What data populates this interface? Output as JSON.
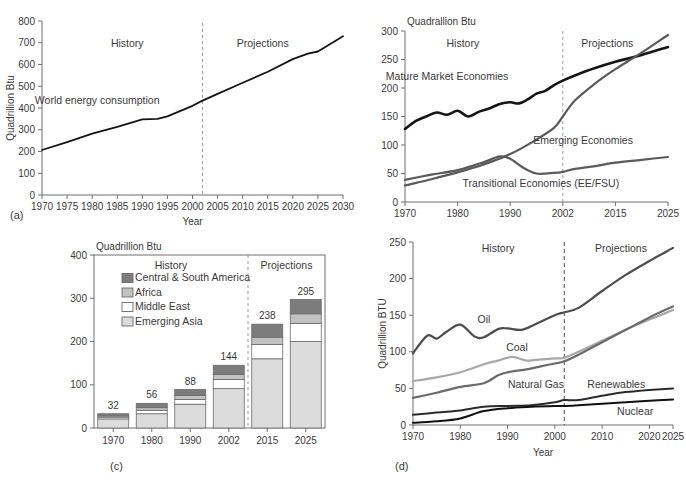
{
  "figure": {
    "panel_labels": [
      "(a)",
      "(b)",
      "(c)",
      "(d)"
    ]
  },
  "chart_data": [
    {
      "id": "a",
      "type": "line",
      "panel_label": "(a)",
      "title": "",
      "xlabel": "Year",
      "ylabel": "Quadrillion Btu",
      "xlim": [
        1970,
        2030
      ],
      "ylim": [
        0,
        800
      ],
      "xticks": [
        1970,
        1975,
        1980,
        1985,
        1990,
        1995,
        2000,
        2005,
        2010,
        2015,
        2020,
        2025,
        2030
      ],
      "yticks": [
        0,
        100,
        200,
        300,
        400,
        500,
        600,
        700,
        800
      ],
      "grid": false,
      "annotations": [
        {
          "text": "History",
          "x": 1987,
          "y": 680
        },
        {
          "text": "Projections",
          "x": 2014,
          "y": 680
        },
        {
          "text": "World energy consumption",
          "x": 1981,
          "y": 420
        }
      ],
      "divider_year": 2002,
      "series": [
        {
          "name": "World energy consumption",
          "color": "#141414",
          "x": [
            1970,
            1975,
            1980,
            1985,
            1990,
            1993,
            1995,
            2000,
            2002,
            2005,
            2010,
            2015,
            2020,
            2023,
            2025,
            2030
          ],
          "values": [
            207,
            243,
            282,
            313,
            348,
            350,
            362,
            410,
            434,
            465,
            516,
            567,
            625,
            650,
            660,
            730
          ]
        }
      ]
    },
    {
      "id": "b",
      "type": "line",
      "panel_label": "(b)",
      "title": "Quadrallion Btu",
      "xlabel": "",
      "ylabel": "",
      "xlim": [
        1970,
        2025
      ],
      "ylim": [
        0,
        300
      ],
      "xticks": [
        1970,
        1980,
        1990,
        2002,
        2015,
        2025
      ],
      "yticks": [
        0,
        50,
        100,
        150,
        200,
        250,
        300
      ],
      "grid": false,
      "divider_year": 2002,
      "annotations": [
        {
          "text": "History",
          "x": 1981,
          "y": 272
        },
        {
          "text": "Projections",
          "x": 2013,
          "y": 272
        },
        {
          "text": "Mature Market Economies",
          "x": 1978,
          "y": 214
        },
        {
          "text": "Emerging Economies",
          "x": 2007,
          "y": 101
        },
        {
          "text": "Transitional Economies (EE/FSU)",
          "x": 1997,
          "y": 27
        }
      ],
      "series": [
        {
          "name": "Mature Market Economies",
          "color": "#151515",
          "width": 2.6,
          "x": [
            1970,
            1972,
            1974,
            1976,
            1978,
            1980,
            1982,
            1984,
            1986,
            1988,
            1990,
            1992,
            1994,
            1996,
            1998,
            2000,
            2002,
            2005,
            2010,
            2015,
            2020,
            2025
          ],
          "values": [
            128,
            142,
            150,
            157,
            153,
            160,
            150,
            158,
            164,
            172,
            175,
            173,
            180,
            190,
            195,
            205,
            213,
            222,
            235,
            246,
            258,
            272
          ]
        },
        {
          "name": "Emerging Economies",
          "color": "#5a5a5a",
          "width": 2.2,
          "x": [
            1970,
            1975,
            1980,
            1985,
            1990,
            1995,
            2000,
            2002,
            2005,
            2010,
            2015,
            2020,
            2025
          ],
          "values": [
            29,
            40,
            52,
            66,
            84,
            105,
            130,
            150,
            178,
            208,
            233,
            262,
            293
          ]
        },
        {
          "name": "Transitional Economies (EE/FSU)",
          "color": "#5a5a5a",
          "width": 2.2,
          "x": [
            1970,
            1975,
            1980,
            1985,
            1988,
            1990,
            1993,
            1996,
            2000,
            2002,
            2005,
            2010,
            2015,
            2020,
            2025
          ],
          "values": [
            39,
            48,
            56,
            70,
            80,
            76,
            60,
            50,
            51,
            53,
            58,
            63,
            69,
            74,
            79
          ]
        }
      ]
    },
    {
      "id": "c",
      "type": "bar",
      "panel_label": "(c)",
      "title": "Quadrillion Btu",
      "xlabel": "",
      "ylabel": "",
      "stacked": true,
      "ylim": [
        0,
        400
      ],
      "yticks": [
        0,
        100,
        200,
        300,
        400
      ],
      "categories": [
        "1970",
        "1980",
        "1990",
        "2002",
        "2015",
        "2025"
      ],
      "totals": [
        32,
        56,
        88,
        144,
        238,
        295
      ],
      "divider_after_category": "2002",
      "annotations": [
        {
          "text": "History",
          "x": "center-left"
        },
        {
          "text": "Projections",
          "x": "center-right"
        }
      ],
      "legend": [
        {
          "label": "Central & South America",
          "color": "#7c7c7c"
        },
        {
          "label": "Africa",
          "color": "#c2c2c2"
        },
        {
          "label": "Middle East",
          "color": "#ffffff"
        },
        {
          "label": "Emerging Asia",
          "color": "#dcdcdc"
        }
      ],
      "series": [
        {
          "name": "Emerging Asia",
          "color": "#dcdcdc",
          "values": [
            21,
            33,
            55,
            91,
            160,
            200
          ]
        },
        {
          "name": "Middle East",
          "color": "#ffffff",
          "values": [
            4,
            8,
            11,
            21,
            33,
            42
          ]
        },
        {
          "name": "Africa",
          "color": "#c2c2c2",
          "values": [
            3,
            6,
            9,
            12,
            17,
            22
          ]
        },
        {
          "name": "Central & South America",
          "color": "#7c7c7c",
          "values": [
            5,
            10,
            14,
            21,
            30,
            33
          ]
        }
      ]
    },
    {
      "id": "d",
      "type": "line",
      "panel_label": "(d)",
      "title": "",
      "xlabel": "Year",
      "ylabel": "Quadrillion BTU",
      "xlim": [
        1970,
        2025
      ],
      "ylim": [
        0,
        250
      ],
      "xticks": [
        1970,
        1980,
        1990,
        2000,
        2010,
        2020,
        2025
      ],
      "yticks": [
        0,
        50,
        100,
        150,
        200,
        250
      ],
      "grid": false,
      "divider_year": 2002,
      "annotations": [
        {
          "text": "History",
          "x": 1988,
          "y": 237
        },
        {
          "text": "Projections",
          "x": 2014,
          "y": 237
        },
        {
          "text": "Oil",
          "x": 1985,
          "y": 140
        },
        {
          "text": "Coal",
          "x": 1992,
          "y": 101
        },
        {
          "text": "Natural Gas",
          "x": 1996,
          "y": 51
        },
        {
          "text": "Renewables",
          "x": 2013,
          "y": 51
        },
        {
          "text": "Nuclear",
          "x": 2017,
          "y": 14
        }
      ],
      "series": [
        {
          "name": "Oil",
          "color": "#4d4d4d",
          "width": 2.2,
          "x": [
            1970,
            1973,
            1975,
            1977,
            1980,
            1983,
            1985,
            1988,
            1990,
            1993,
            1996,
            2000,
            2002,
            2005,
            2010,
            2015,
            2020,
            2025
          ],
          "values": [
            98,
            122,
            118,
            127,
            137,
            121,
            120,
            131,
            132,
            130,
            138,
            150,
            154,
            160,
            183,
            205,
            224,
            242
          ]
        },
        {
          "name": "Coal",
          "color": "#a8a8a8",
          "width": 2.2,
          "x": [
            1970,
            1975,
            1980,
            1985,
            1988,
            1991,
            1994,
            1996,
            2000,
            2002,
            2005,
            2010,
            2015,
            2020,
            2025
          ],
          "values": [
            60,
            65,
            72,
            83,
            88,
            93,
            88,
            89,
            91,
            92,
            100,
            115,
            130,
            144,
            157
          ]
        },
        {
          "name": "Natural Gas",
          "color": "#6b6b6b",
          "width": 2.2,
          "x": [
            1970,
            1975,
            1980,
            1985,
            1988,
            1990,
            1994,
            1997,
            2000,
            2002,
            2005,
            2010,
            2015,
            2020,
            2025
          ],
          "values": [
            37,
            44,
            52,
            57,
            68,
            72,
            76,
            80,
            84,
            87,
            96,
            113,
            130,
            147,
            162
          ]
        },
        {
          "name": "Renewables",
          "color": "#2b2b2b",
          "width": 2.0,
          "x": [
            1970,
            1975,
            1980,
            1985,
            1990,
            1995,
            2000,
            2002,
            2005,
            2010,
            2015,
            2020,
            2025
          ],
          "values": [
            14,
            17,
            20,
            25,
            26,
            27,
            31,
            34,
            34,
            40,
            45,
            48,
            50
          ]
        },
        {
          "name": "Nuclear",
          "color": "#111111",
          "width": 2.0,
          "x": [
            1970,
            1975,
            1980,
            1985,
            1990,
            1995,
            2000,
            2002,
            2005,
            2010,
            2015,
            2020,
            2025
          ],
          "values": [
            3,
            5,
            9,
            19,
            23,
            25,
            26,
            26,
            27,
            29,
            31,
            33,
            35
          ]
        }
      ]
    }
  ]
}
